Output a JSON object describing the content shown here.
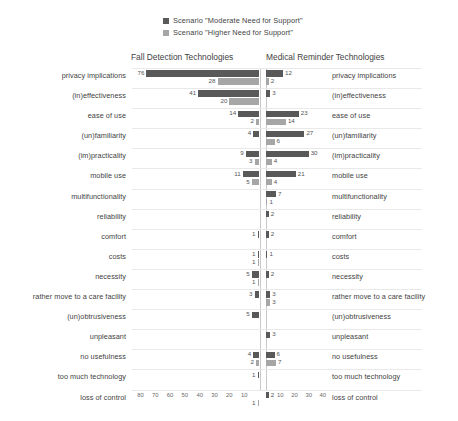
{
  "chart_data": {
    "type": "bar",
    "subtype": "diverging-horizontal-butterfly",
    "title": "",
    "legend": {
      "position": "top-center",
      "entries": [
        {
          "name": "Scenario \"Moderate Need for Support\"",
          "color": "#595959"
        },
        {
          "name": "Scenario \"Higher Need for Support\"",
          "color": "#a6a6a6"
        }
      ]
    },
    "panels": [
      {
        "title": "Fall Detection Technologies",
        "direction": "left",
        "xlabel": "",
        "ylabel": "",
        "xlim": [
          0,
          85
        ],
        "ticks": [
          "80",
          "70",
          "60",
          "50",
          "40",
          "30",
          "20",
          "10"
        ],
        "tick_values": [
          80,
          70,
          60,
          50,
          40,
          30,
          20,
          10
        ]
      },
      {
        "title": "Medical Reminder Technologies",
        "direction": "right",
        "xlabel": "",
        "ylabel": "",
        "xlim": [
          0,
          45
        ],
        "ticks": [
          "10",
          "20",
          "30",
          "40"
        ],
        "tick_values": [
          10,
          20,
          30,
          40
        ]
      }
    ],
    "grid": false,
    "categories": [
      "privacy implications",
      "(in)effectiveness",
      "ease of use",
      "(un)familiarity",
      "(im)practicality",
      "mobile use",
      "multifunctionality",
      "reliability",
      "comfort",
      "costs",
      "necessity",
      "rather move to a care facility",
      "(un)obtrusiveness",
      "unpleasant",
      "no usefulness",
      "too much technology",
      "loss of control"
    ],
    "series": [
      {
        "name": "Scenario \"Moderate Need for Support\"",
        "panel": "Fall Detection Technologies",
        "color": "#595959",
        "values": [
          76,
          41,
          14,
          4,
          9,
          11,
          0,
          0,
          1,
          1,
          5,
          3,
          5,
          0,
          4,
          1,
          0
        ]
      },
      {
        "name": "Scenario \"Higher Need for Support\"",
        "panel": "Fall Detection Technologies",
        "color": "#a6a6a6",
        "values": [
          28,
          20,
          2,
          0,
          3,
          5,
          0,
          0,
          0,
          1,
          1,
          0,
          0,
          0,
          2,
          0,
          1
        ]
      },
      {
        "name": "Scenario \"Moderate Need for Support\"",
        "panel": "Medical Reminder Technologies",
        "color": "#595959",
        "values": [
          12,
          3,
          23,
          27,
          30,
          21,
          7,
          2,
          2,
          1,
          2,
          3,
          0,
          3,
          6,
          0,
          2
        ]
      },
      {
        "name": "Scenario \"Higher Need for Support\"",
        "panel": "Medical Reminder Technologies",
        "color": "#a6a6a6",
        "values": [
          2,
          0,
          14,
          6,
          4,
          4,
          1,
          0,
          0,
          0,
          0,
          3,
          0,
          0,
          7,
          0,
          0
        ]
      }
    ]
  }
}
